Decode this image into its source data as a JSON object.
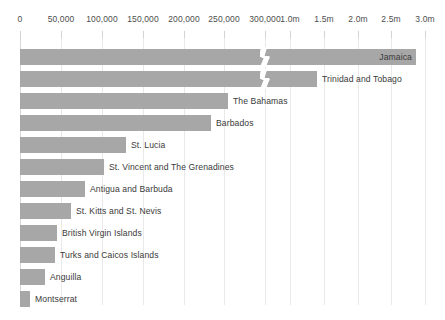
{
  "chart_data": {
    "type": "bar",
    "orientation": "horizontal",
    "title": "",
    "subtitle": "",
    "xlabel": "",
    "ylabel": "",
    "grid": true,
    "legend": null,
    "axis_break": {
      "present": true,
      "after_value": 300000,
      "resume_value": 750000,
      "note": "broken x-axis between the 300,000 tick and the 1.0m tick"
    },
    "axis": {
      "segments": [
        {
          "name": "lower",
          "range": [
            0,
            300000
          ],
          "ticks": [
            0,
            50000,
            100000,
            150000,
            200000,
            250000,
            300000
          ],
          "tick_labels": [
            "0",
            "50,000",
            "100,000",
            "150,000",
            "200,000",
            "250,000",
            "300,000"
          ],
          "pixel_start": 20,
          "pixel_end": 265
        },
        {
          "name": "upper",
          "range": [
            1000000,
            3000000
          ],
          "ticks": [
            1000000,
            1500000,
            2000000,
            2500000,
            3000000
          ],
          "tick_labels": [
            "1.0m",
            "1.5m",
            "2.0m",
            "2.5m",
            "3.0m"
          ],
          "pixel_start": 290,
          "pixel_end": 425
        }
      ]
    },
    "categories": [
      "Jamaica",
      "Trinidad and Tobago",
      "The Bahamas",
      "Barbados",
      "St. Lucia",
      "St. Vincent and The Grenadines",
      "Antigua and Barbuda",
      "St. Kitts and St. Nevis",
      "British Virgin Islands",
      "Turks and Caicos Islands",
      "Anguilla",
      "Montserrat"
    ],
    "values": [
      2780000,
      1390000,
      255000,
      234000,
      130000,
      103000,
      80000,
      63000,
      45000,
      43000,
      30000,
      12000
    ],
    "value_labels": [
      "2.78m",
      "1.39m",
      "255,000",
      "234,000",
      "130,000",
      "103,000",
      "80,000",
      "63,000",
      "45,000",
      "43,000",
      "30,000",
      "12,000"
    ],
    "colors": {
      "bar": "#a7a7a7",
      "grid": "#e9e9e9",
      "axis": "#d8d8d8",
      "text": "#3a3a3a",
      "tick_text": "#4d4d4d",
      "background": "#ffffff"
    }
  },
  "axis_ticks": [
    {
      "label": "0",
      "x": 20
    },
    {
      "label": "50,000",
      "x": 61
    },
    {
      "label": "100,000",
      "x": 102
    },
    {
      "label": "150,000",
      "x": 143
    },
    {
      "label": "200,000",
      "x": 184
    },
    {
      "label": "250,000",
      "x": 224
    },
    {
      "label": "300,000",
      "x": 265
    },
    {
      "label": "1.0m",
      "x": 290
    },
    {
      "label": "1.5m",
      "x": 324
    },
    {
      "label": "2.0m",
      "x": 358
    },
    {
      "label": "2.5m",
      "x": 391
    },
    {
      "label": "3.0m",
      "x": 425
    }
  ],
  "bars": [
    {
      "label": "Jamaica",
      "width": 396,
      "y": 46,
      "break_x": 262,
      "label_inside": true
    },
    {
      "label": "Trinidad and Tobago",
      "width": 297,
      "y": 68,
      "break_x": 262,
      "label_inside": false
    },
    {
      "label": "The Bahamas",
      "width": 208,
      "y": 90,
      "break_x": null,
      "label_inside": false
    },
    {
      "label": "Barbados",
      "width": 191,
      "y": 112,
      "break_x": null,
      "label_inside": false
    },
    {
      "label": "St. Lucia",
      "width": 106,
      "y": 134,
      "break_x": null,
      "label_inside": false
    },
    {
      "label": "St. Vincent and The Grenadines",
      "width": 84,
      "y": 156,
      "break_x": null,
      "label_inside": false
    },
    {
      "label": "Antigua and Barbuda",
      "width": 65,
      "y": 178,
      "break_x": null,
      "label_inside": false
    },
    {
      "label": "St. Kitts and St. Nevis",
      "width": 51,
      "y": 200,
      "break_x": null,
      "label_inside": false
    },
    {
      "label": "British Virgin Islands",
      "width": 37,
      "y": 222,
      "break_x": null,
      "label_inside": false
    },
    {
      "label": "Turks and Caicos Islands",
      "width": 35,
      "y": 244,
      "break_x": null,
      "label_inside": false
    },
    {
      "label": "Anguilla",
      "width": 25,
      "y": 266,
      "break_x": null,
      "label_inside": false
    },
    {
      "label": "Montserrat",
      "width": 10,
      "y": 288,
      "break_x": null,
      "label_inside": false
    }
  ],
  "grid_x": [
    20,
    61,
    102,
    143,
    184,
    224,
    265,
    290,
    324,
    358,
    391,
    425
  ]
}
